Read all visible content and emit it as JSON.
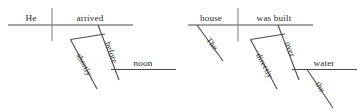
{
  "figure": {
    "kind": "reed-kellogg-sentence-diagram",
    "ink_color": "#4a4a4a",
    "divider_color": "#8a8a8a",
    "text_color": "#2b2b2b",
    "background_color": "#ffffff"
  },
  "diagrams": [
    {
      "id": "left",
      "sentence": "He arrived shortly before noon.",
      "subject": "He",
      "predicate": "arrived",
      "labels": {
        "subject": "He",
        "verb": "arrived",
        "preposition": "before",
        "object_of_preposition": "noon",
        "adverb": "shortly"
      }
    },
    {
      "id": "right",
      "sentence": "The house was built directly over the water.",
      "subject": "house",
      "predicate": "was built",
      "labels": {
        "subject": "house",
        "verb": "was built",
        "subject_modifier": "The",
        "preposition": "over",
        "object_of_preposition": "water",
        "object_modifier": "the",
        "adverb": "directly"
      }
    }
  ]
}
